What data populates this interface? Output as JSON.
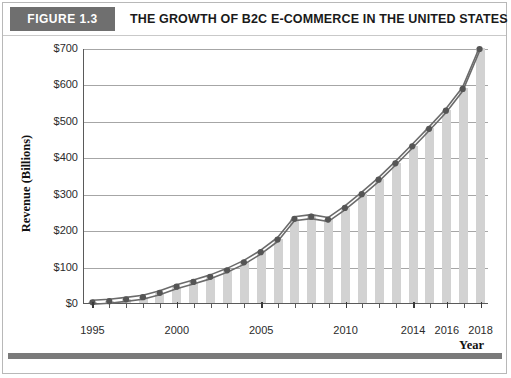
{
  "figure": {
    "tab_label": "FIGURE 1.3",
    "title": "THE GROWTH OF B2C E-COMMERCE IN THE UNITED STATES"
  },
  "colors": {
    "tab_background": "#6f6f6f",
    "tab_text": "#ffffff",
    "title_text": "#1a1a1a",
    "bar_fill": "#d2d2d2",
    "line_stroke": "#6b6b6b",
    "marker_fill": "#555555",
    "gridline": "#a6a6a6",
    "axis": "#5a5a5a",
    "frame_border": "#b8b8b8",
    "bottom_band": "#7a7a7a"
  },
  "chart_data": {
    "type": "line",
    "title": "THE GROWTH OF B2C E-COMMERCE IN THE UNITED STATES",
    "xlabel": "Year",
    "ylabel": "Revenue (Billions)",
    "grid": true,
    "legend": "none",
    "xlim": [
      1995,
      2018
    ],
    "ylim": [
      0,
      700
    ],
    "ytick_labels": [
      "$700",
      "$600",
      "$500",
      "$400",
      "$300",
      "$200",
      "$100",
      "$0"
    ],
    "ytick_values": [
      700,
      600,
      500,
      400,
      300,
      200,
      100,
      0
    ],
    "xtick_labels": [
      "1995",
      "2000",
      "2005",
      "2010",
      "2014",
      "2016",
      "2018"
    ],
    "xtick_values": [
      1995,
      2000,
      2005,
      2010,
      2014,
      2016,
      2018
    ],
    "x": [
      1995,
      1996,
      1997,
      1998,
      1999,
      2000,
      2001,
      2002,
      2003,
      2004,
      2005,
      2006,
      2007,
      2008,
      2009,
      2010,
      2011,
      2012,
      2013,
      2014,
      2015,
      2016,
      2017,
      2018
    ],
    "series": [
      {
        "name": "B2C E-commerce Revenue",
        "values": [
          2,
          5,
          10,
          16,
          28,
          45,
          58,
          72,
          90,
          112,
          140,
          175,
          232,
          238,
          230,
          262,
          300,
          340,
          385,
          432,
          480,
          530,
          590,
          700
        ],
        "marker": "circle",
        "line_style": "double-rule"
      }
    ],
    "bars": {
      "name": "Revenue bars",
      "values": [
        2,
        5,
        10,
        16,
        28,
        45,
        58,
        72,
        90,
        112,
        140,
        175,
        232,
        238,
        230,
        262,
        300,
        340,
        385,
        432,
        480,
        530,
        590,
        700
      ]
    }
  }
}
